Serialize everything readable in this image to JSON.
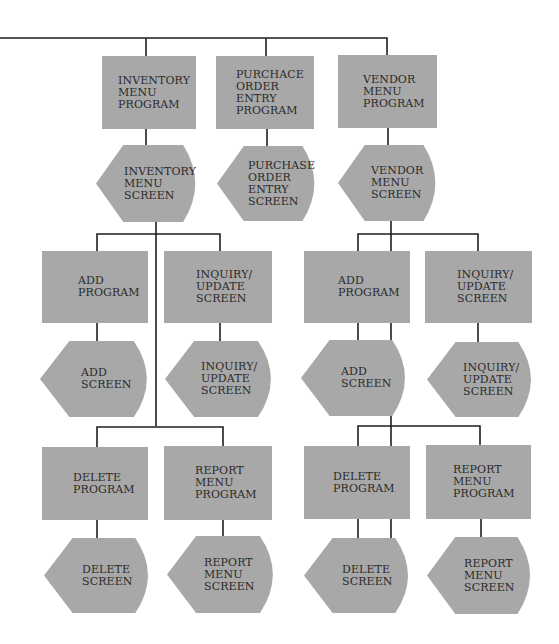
{
  "colors": {
    "shape_fill": "#a8a8a8",
    "line": "#1e1e1e",
    "text": "#2b2b2b",
    "background": "#ffffff"
  },
  "diagram": {
    "type": "hierarchy-chart",
    "programs": [
      {
        "id": "inventory-menu-program",
        "kind": "program",
        "lines": [
          "INVENTORY",
          "MENU",
          "PROGRAM"
        ],
        "box": [
          102,
          56,
          94,
          73
        ],
        "text_left": 16
      },
      {
        "id": "purchase-order-entry-program",
        "kind": "program",
        "lines": [
          "PURCHACE",
          "ORDER",
          "ENTRY",
          "PROGRAM"
        ],
        "box": [
          216,
          56,
          98,
          73
        ],
        "text_left": 20
      },
      {
        "id": "vendor-menu-program",
        "kind": "program",
        "lines": [
          "VENDOR",
          "MENU",
          "PROGRAM"
        ],
        "box": [
          338,
          55,
          99,
          73
        ],
        "text_left": 25
      },
      {
        "id": "add-program-left",
        "kind": "program",
        "lines": [
          "ADD",
          "PROGRAM"
        ],
        "box": [
          42,
          251,
          106,
          72
        ],
        "text_left": 36
      },
      {
        "id": "inquiry-update-left",
        "kind": "program",
        "lines": [
          "INQUIRY/",
          "UPDATE",
          "SCREEN"
        ],
        "box": [
          164,
          251,
          108,
          72
        ],
        "text_left": 32
      },
      {
        "id": "delete-program-left",
        "kind": "program",
        "lines": [
          "DELETE",
          "PROGRAM"
        ],
        "box": [
          42,
          447,
          106,
          73
        ],
        "text_left": 31
      },
      {
        "id": "report-menu-program-left",
        "kind": "program",
        "lines": [
          "REPORT",
          "MENU",
          "PROGRAM"
        ],
        "box": [
          164,
          446,
          108,
          74
        ],
        "text_left": 31
      },
      {
        "id": "add-program-right",
        "kind": "program",
        "lines": [
          "ADD",
          "PROGRAM"
        ],
        "box": [
          304,
          251,
          106,
          72
        ],
        "text_left": 34
      },
      {
        "id": "inquiry-update-right",
        "kind": "program",
        "lines": [
          "INQUIRY/",
          "UPDATE",
          "SCREEN"
        ],
        "box": [
          425,
          251,
          107,
          72
        ],
        "text_left": 32
      },
      {
        "id": "delete-program-right",
        "kind": "program",
        "lines": [
          "DELETE",
          "PROGRAM"
        ],
        "box": [
          304,
          446,
          106,
          73
        ],
        "text_left": 29
      },
      {
        "id": "report-menu-program-right",
        "kind": "program",
        "lines": [
          "REPORT",
          "MENU",
          "PROGRAM"
        ],
        "box": [
          426,
          445,
          105,
          74
        ],
        "text_left": 27
      }
    ],
    "screens": [
      {
        "id": "inventory-menu-screen",
        "kind": "screen",
        "lines": [
          "INVENTORY",
          "MENU",
          "SCREEN"
        ],
        "box": [
          96,
          145,
          105,
          77
        ],
        "text_left": 28
      },
      {
        "id": "purchase-order-entry-screen",
        "kind": "screen",
        "lines": [
          "PURCHASE",
          "ORDER",
          "ENTRY",
          "SCREEN"
        ],
        "box": [
          217,
          146,
          103,
          75
        ],
        "text_left": 31
      },
      {
        "id": "vendor-menu-screen",
        "kind": "screen",
        "lines": [
          "VENDOR",
          "MENU",
          "SCREEN"
        ],
        "box": [
          338,
          145,
          103,
          76
        ],
        "text_left": 33
      },
      {
        "id": "add-screen-left",
        "kind": "screen",
        "lines": [
          "ADD",
          "SCREEN"
        ],
        "box": [
          40,
          341,
          113,
          76
        ],
        "text_left": 41
      },
      {
        "id": "inquiry-update-screen-left",
        "kind": "screen",
        "lines": [
          "INQUIRY/",
          "UPDATE",
          "SCREEN"
        ],
        "box": [
          165,
          341,
          112,
          76
        ],
        "text_left": 36
      },
      {
        "id": "delete-screen-left",
        "kind": "screen",
        "lines": [
          "DELETE",
          "SCREEN"
        ],
        "box": [
          44,
          538,
          110,
          75
        ],
        "text_left": 38
      },
      {
        "id": "report-menu-screen-left",
        "kind": "screen",
        "lines": [
          "REPORT",
          "MENU",
          "SCREEN"
        ],
        "box": [
          167,
          536,
          112,
          77
        ],
        "text_left": 37
      },
      {
        "id": "add-screen-right",
        "kind": "screen",
        "lines": [
          "ADD",
          "SCREEN"
        ],
        "box": [
          301,
          340,
          110,
          76
        ],
        "text_left": 40
      },
      {
        "id": "inquiry-update-screen-right",
        "kind": "screen",
        "lines": [
          "INQUIRY/",
          "UPDATE",
          "SCREEN"
        ],
        "box": [
          427,
          342,
          110,
          75
        ],
        "text_left": 36
      },
      {
        "id": "delete-screen-right",
        "kind": "screen",
        "lines": [
          "DELETE",
          "SCREEN"
        ],
        "box": [
          304,
          538,
          110,
          75
        ],
        "text_left": 38
      },
      {
        "id": "report-menu-screen-right",
        "kind": "screen",
        "lines": [
          "REPORT",
          "MENU",
          "SCREEN"
        ],
        "box": [
          427,
          537,
          109,
          77
        ],
        "text_left": 37
      }
    ],
    "connectors": [
      [
        [
          0,
          38
        ],
        [
          387,
          38
        ],
        [
          387,
          56
        ]
      ],
      [
        [
          146,
          38
        ],
        [
          146,
          56
        ]
      ],
      [
        [
          266,
          38
        ],
        [
          266,
          56
        ]
      ],
      [
        [
          146,
          129
        ],
        [
          146,
          145
        ]
      ],
      [
        [
          267,
          129
        ],
        [
          267,
          146
        ]
      ],
      [
        [
          388,
          128
        ],
        [
          388,
          145
        ]
      ],
      [
        [
          156,
          222
        ],
        [
          156,
          426
        ]
      ],
      [
        [
          97,
          251
        ],
        [
          97,
          234
        ],
        [
          220,
          234
        ],
        [
          220,
          251
        ]
      ],
      [
        [
          97,
          323
        ],
        [
          97,
          341
        ]
      ],
      [
        [
          220,
          323
        ],
        [
          220,
          341
        ]
      ],
      [
        [
          97,
          447
        ],
        [
          97,
          427
        ],
        [
          223,
          427
        ],
        [
          223,
          446
        ]
      ],
      [
        [
          97,
          520
        ],
        [
          97,
          538
        ]
      ],
      [
        [
          223,
          520
        ],
        [
          223,
          536
        ]
      ],
      [
        [
          391,
          221
        ],
        [
          391,
          605
        ]
      ],
      [
        [
          358,
          251
        ],
        [
          358,
          234
        ],
        [
          478,
          234
        ],
        [
          478,
          251
        ]
      ],
      [
        [
          358,
          323
        ],
        [
          358,
          340
        ]
      ],
      [
        [
          478,
          323
        ],
        [
          478,
          342
        ]
      ],
      [
        [
          358,
          446
        ],
        [
          358,
          426
        ],
        [
          480,
          426
        ],
        [
          480,
          445
        ]
      ],
      [
        [
          358,
          519
        ],
        [
          358,
          538
        ]
      ],
      [
        [
          481,
          519
        ],
        [
          481,
          537
        ]
      ]
    ]
  }
}
